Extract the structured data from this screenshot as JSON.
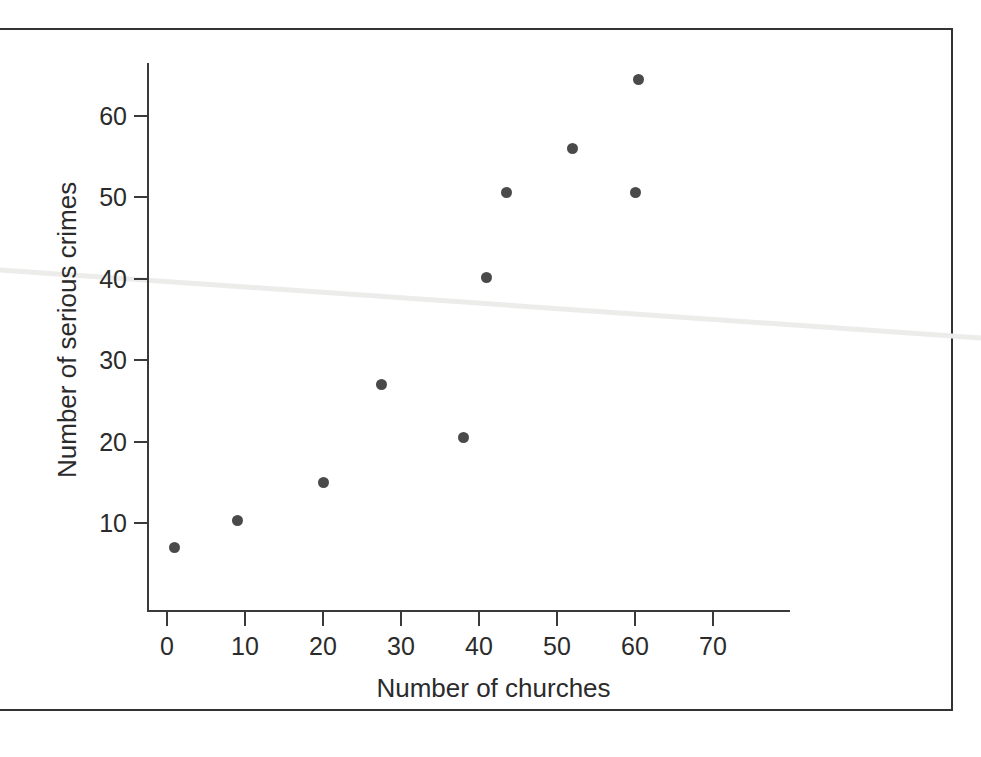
{
  "figure": {
    "background_color": "#ffffff",
    "frame_color": "#333333",
    "ink_color": "#2b2b2b",
    "point_color": "#4a4a4a",
    "crease_color": "#eeeeec"
  },
  "chart_data": {
    "type": "scatter",
    "title": "",
    "xlabel": "Number of churches",
    "ylabel": "Number of serious crimes",
    "xlim": [
      -1,
      77
    ],
    "ylim": [
      2,
      67
    ],
    "grid": false,
    "legend": "none",
    "x_ticks": [
      0,
      10,
      20,
      30,
      40,
      50,
      60,
      70
    ],
    "x_tick_labels": [
      "0",
      "10",
      "20",
      "30",
      "40",
      "50",
      "60",
      "70"
    ],
    "y_ticks": [
      10,
      20,
      30,
      40,
      50,
      60
    ],
    "y_tick_labels": [
      "10",
      "20",
      "30",
      "40",
      "50",
      "60"
    ],
    "x": [
      1,
      9,
      20,
      27.5,
      38,
      41,
      43.5,
      52,
      60,
      60.5
    ],
    "y": [
      7,
      10.3,
      15,
      27,
      20.5,
      40.2,
      50.6,
      56,
      50.6,
      64.5
    ],
    "points": [
      {
        "x": 1,
        "y": 7
      },
      {
        "x": 9,
        "y": 10.3
      },
      {
        "x": 20,
        "y": 15
      },
      {
        "x": 27.5,
        "y": 27
      },
      {
        "x": 38,
        "y": 20.5
      },
      {
        "x": 41,
        "y": 40.2
      },
      {
        "x": 43.5,
        "y": 50.6
      },
      {
        "x": 52,
        "y": 56
      },
      {
        "x": 60,
        "y": 50.6
      },
      {
        "x": 60.5,
        "y": 64.5
      }
    ]
  }
}
